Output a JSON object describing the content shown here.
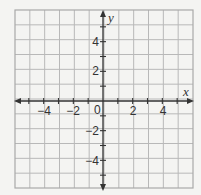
{
  "chart_data": {
    "type": "scatter",
    "title": "",
    "xlabel": "x",
    "ylabel": "y",
    "xlim": [
      -6,
      6
    ],
    "ylim": [
      -6,
      6
    ],
    "grid": true,
    "grid_step": 1,
    "x_tick_labels": [
      "-4",
      "-2",
      "2",
      "4"
    ],
    "y_tick_labels": [
      "4",
      "2",
      "-2",
      "-4"
    ],
    "origin_label": "0",
    "series": []
  },
  "labels": {
    "x_axis": "x",
    "y_axis": "y",
    "origin": "0",
    "x_ticks": [
      {
        "value": -4,
        "text": "−4"
      },
      {
        "value": -2,
        "text": "−2"
      },
      {
        "value": 2,
        "text": "2"
      },
      {
        "value": 4,
        "text": "4"
      }
    ],
    "y_ticks": [
      {
        "value": 4,
        "text": "4"
      },
      {
        "value": 2,
        "text": "2"
      },
      {
        "value": -2,
        "text": "−2"
      },
      {
        "value": -4,
        "text": "−4"
      }
    ]
  }
}
